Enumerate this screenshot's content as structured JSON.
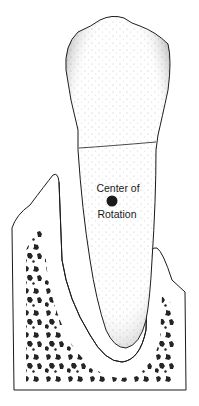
{
  "diagram": {
    "labels": {
      "line1": "Center of",
      "line2": "Rotation"
    },
    "colors": {
      "ink": "#1a1a1a",
      "background": "#ffffff"
    },
    "parts": [
      "tooth-crown",
      "tooth-root",
      "cemento-enamel-junction",
      "periodontal-ligament-space",
      "alveolar-bone",
      "cancellous-bone-marrow",
      "center-of-rotation-point"
    ]
  }
}
